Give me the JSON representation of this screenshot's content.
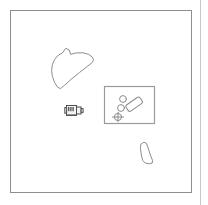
{
  "app": {
    "title": "Scene Canvas",
    "background_color": "#ffffff"
  },
  "canvas": {
    "frame_label": "canvas-frame",
    "border_color": "#8e8e8e",
    "x": 10,
    "y": 10,
    "width": 182,
    "height": 183
  },
  "panel_edge": {
    "label": "panel-divider",
    "color": "#c9c9c9"
  },
  "objects": [
    {
      "id": "blob",
      "label": "irregular-blob-outline",
      "stroke_color": "#8c8c8c",
      "bbox": {
        "x": 51,
        "y": 46,
        "width": 44,
        "height": 44
      }
    },
    {
      "id": "device",
      "label": "machine-device-icon",
      "stroke_color": "#4e4e4e",
      "fill_color": "#f2f2f2",
      "bbox": {
        "x": 66,
        "y": 104,
        "width": 17,
        "height": 13
      }
    },
    {
      "id": "panel-box",
      "label": "rectangle-panel",
      "stroke_color": "#9a9a9a",
      "fill_color": "#ffffff",
      "bbox": {
        "x": 104,
        "y": 86,
        "width": 51,
        "height": 38
      }
    },
    {
      "id": "circle-a",
      "label": "small-circle-upper",
      "stroke_color": "#8c8c8c",
      "center": {
        "x": 123,
        "y": 99
      },
      "radius": 3.4
    },
    {
      "id": "circle-b",
      "label": "small-circle-middle",
      "stroke_color": "#8c8c8c",
      "center": {
        "x": 121,
        "y": 108
      },
      "radius": 3.4
    },
    {
      "id": "circle-c",
      "label": "small-circle-crosshair",
      "stroke_color": "#8c8c8c",
      "center": {
        "x": 118,
        "y": 117
      },
      "radius": 3.6
    },
    {
      "id": "rounded-rect",
      "label": "rotated-rounded-rectangle",
      "stroke_color": "#8c8c8c",
      "center": {
        "x": 134,
        "y": 104
      },
      "rotation_deg": -35
    },
    {
      "id": "teardrop",
      "label": "teardrop-bottle-shape",
      "stroke_color": "#8c8c8c",
      "bbox": {
        "x": 139,
        "y": 142,
        "width": 14,
        "height": 22
      }
    }
  ],
  "counts": {
    "objects_total": 8,
    "circles": 3
  }
}
